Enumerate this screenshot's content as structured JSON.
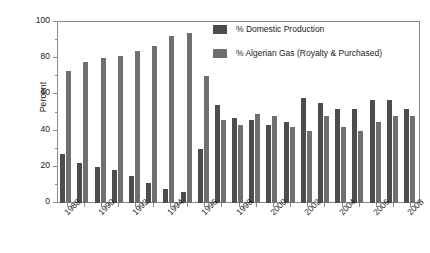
{
  "chart_data": {
    "type": "bar",
    "title": "",
    "subtitle": "",
    "xlabel": "",
    "ylabel": "Percent",
    "ylim": [
      0,
      100
    ],
    "ytick_values": [
      0,
      20,
      40,
      60,
      80,
      100
    ],
    "ytick_labels": [
      "0",
      "20",
      "40",
      "60",
      "80",
      "100"
    ],
    "yminor_values": [
      10,
      30,
      50,
      70,
      90
    ],
    "grid": false,
    "legend_position": "upper right",
    "categories": [
      "1988",
      "1989",
      "1990",
      "1991",
      "1992",
      "1993",
      "1994",
      "1995",
      "1996",
      "1997",
      "1998",
      "1999",
      "2000",
      "2001",
      "2002",
      "2003",
      "2004",
      "2005",
      "2006",
      "2007",
      "2008"
    ],
    "xtick_labels": [
      "1988",
      "1990",
      "1992",
      "1994",
      "1996",
      "1998",
      "2000",
      "2002",
      "2004",
      "2006",
      "2008"
    ],
    "series": [
      {
        "name": "% Domestic Production",
        "color": "#4d4d4d",
        "values": [
          27,
          22,
          20,
          18,
          15,
          11,
          8,
          6,
          30,
          54,
          47,
          46,
          43,
          45,
          58,
          55,
          52,
          52,
          57,
          57,
          52
        ]
      },
      {
        "name": "% Algerian Gas (Royalty & Purchased)",
        "color": "#6f6f6f",
        "values": [
          73,
          78,
          80,
          81,
          84,
          87,
          92,
          94,
          70,
          46,
          43,
          49,
          48,
          42,
          40,
          48,
          42,
          40,
          45,
          48,
          48
        ]
      }
    ]
  },
  "legend": {
    "items": [
      {
        "label": "% Domestic Production",
        "color": "#4d4d4d"
      },
      {
        "label": "% Algerian Gas (Royalty & Purchased)",
        "color": "#6f6f6f"
      }
    ]
  },
  "axes": {
    "y_title": "Percent"
  }
}
